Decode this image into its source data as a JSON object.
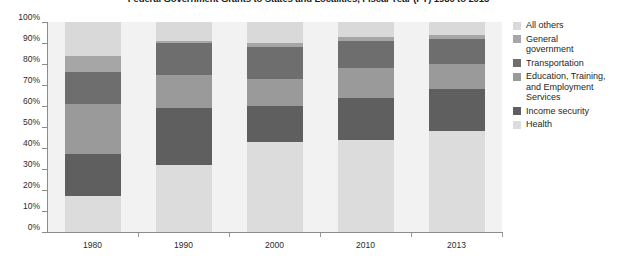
{
  "chart_data": {
    "type": "bar",
    "subtype": "stacked-100-percent",
    "title": "Federal Government Grants to States and Localities, Fiscal Year (FY) 1980 to 2013",
    "xlabel": "",
    "ylabel": "",
    "ylim": [
      0,
      100
    ],
    "ytick_labels": [
      "0%",
      "10%",
      "20%",
      "30%",
      "40%",
      "50%",
      "60%",
      "70%",
      "80%",
      "90%",
      "100%"
    ],
    "ytick_values": [
      0,
      10,
      20,
      30,
      40,
      50,
      60,
      70,
      80,
      90,
      100
    ],
    "grid": false,
    "legend_position": "right",
    "categories": [
      "1980",
      "1990",
      "2000",
      "2010",
      "2013"
    ],
    "series": [
      {
        "name": "Health",
        "color": "#dcdcdc",
        "values": [
          17,
          32,
          43,
          44,
          48
        ]
      },
      {
        "name": "Income security",
        "color": "#5f5f5f",
        "values": [
          20,
          27,
          17,
          20,
          20
        ]
      },
      {
        "name": "Education, Training,\nand Employment\nServices",
        "color": "#9a9a9a",
        "values": [
          24,
          16,
          13,
          14,
          12
        ]
      },
      {
        "name": "Transportation",
        "color": "#6e6e6e",
        "values": [
          15,
          15,
          15,
          13,
          12
        ]
      },
      {
        "name": "General\ngovernment",
        "color": "#a6a6a6",
        "values": [
          8,
          1,
          2,
          2,
          2
        ]
      },
      {
        "name": "All others",
        "color": "#d9d9d9",
        "values": [
          16,
          9,
          10,
          7,
          6
        ]
      }
    ]
  },
  "legend": {
    "items": [
      {
        "label": "All others",
        "color": "#d9d9d9"
      },
      {
        "label": "General\ngovernment",
        "color": "#a6a6a6"
      },
      {
        "label": "Transportation",
        "color": "#6e6e6e"
      },
      {
        "label": "Education, Training,\nand Employment\nServices",
        "color": "#9a9a9a"
      },
      {
        "label": "Income security",
        "color": "#5f5f5f"
      },
      {
        "label": "Health",
        "color": "#dcdcdc"
      }
    ]
  },
  "style": {
    "plot_background": "#f2f2f2",
    "axis_color": "#8c8c8c",
    "text_color": "#262626",
    "page_background": "#ffffff"
  }
}
